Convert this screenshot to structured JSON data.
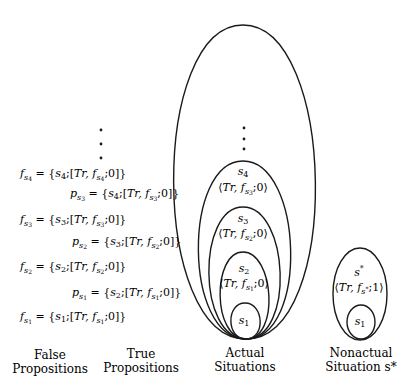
{
  "false_propositions": {
    "label_line1": "False",
    "label_line2": "Propositions",
    "items": [
      {
        "name": "f",
        "sub": "s4",
        "situation": "s4",
        "arg": "f",
        "argsub": "s4",
        "polarity": "0"
      },
      {
        "name": "f",
        "sub": "s3",
        "situation": "s3",
        "arg": "f",
        "argsub": "s3",
        "polarity": "0"
      },
      {
        "name": "f",
        "sub": "s2",
        "situation": "s2",
        "arg": "f",
        "argsub": "s2",
        "polarity": "0"
      },
      {
        "name": "f",
        "sub": "s1",
        "situation": "s1",
        "arg": "f",
        "argsub": "s1",
        "polarity": "0"
      }
    ]
  },
  "true_propositions": {
    "label_line1": "True",
    "label_line2": "Propositions",
    "items": [
      {
        "name": "p",
        "sub": "s3",
        "situation": "s4",
        "arg": "f",
        "argsub": "s3",
        "polarity": "0"
      },
      {
        "name": "p",
        "sub": "s2",
        "situation": "s3",
        "arg": "f",
        "argsub": "s2",
        "polarity": "0"
      },
      {
        "name": "p",
        "sub": "s1",
        "situation": "s2",
        "arg": "f",
        "argsub": "s1",
        "polarity": "0"
      }
    ]
  },
  "actual_situations": {
    "label_line1": "Actual",
    "label_line2": "Situations",
    "nested": [
      {
        "name": "s4",
        "fact": "⟨Tr, f_s3; 0⟩"
      },
      {
        "name": "s3",
        "fact": "⟨Tr, f_s2; 0⟩"
      },
      {
        "name": "s2",
        "fact": "⟨Tr, f_s1; 0⟩"
      },
      {
        "name": "s1",
        "fact": ""
      }
    ]
  },
  "nonactual_situation": {
    "label_line1": "Nonactual",
    "label_line2": "Situation s*",
    "outer": {
      "name": "s*",
      "fact": "⟨Tr, f_s*; 1⟩"
    },
    "inner": {
      "name": "s1"
    }
  },
  "relation": "Tr",
  "ellipsis": "⋮"
}
